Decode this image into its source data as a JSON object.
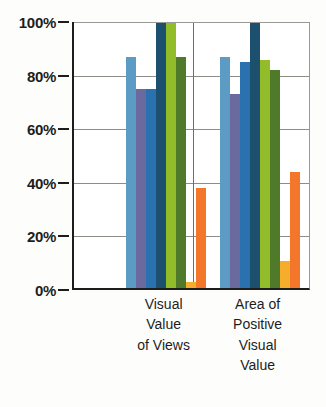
{
  "chart_data": {
    "type": "bar",
    "title": "",
    "subtitle": "",
    "xlabel": "",
    "ylabel": "",
    "ylim": [
      0,
      100
    ],
    "grid": true,
    "legend": "none",
    "y_tick_labels": [
      "100%",
      "80%",
      "60%",
      "40%",
      "20%",
      "0%"
    ],
    "y_tick_values": [
      100,
      80,
      60,
      40,
      20,
      0
    ],
    "categories": [
      "Visual Value of Views",
      "Area of Positive Visual Value"
    ],
    "category_label_lines": [
      [
        "Visual",
        "Value",
        "of Views"
      ],
      [
        "Area of",
        "Positive",
        "Visual",
        "Value"
      ]
    ],
    "series": [
      {
        "name": "series-1",
        "color": "#5b9bc4",
        "values": [
          87,
          87
        ]
      },
      {
        "name": "series-2",
        "color": "#6b6a9e",
        "values": [
          75,
          73
        ]
      },
      {
        "name": "series-3",
        "color": "#2a72af",
        "values": [
          75,
          85
        ]
      },
      {
        "name": "series-4",
        "color": "#1d4f6e",
        "values": [
          104,
          104
        ]
      },
      {
        "name": "series-5",
        "color": "#93bc2b",
        "values": [
          104,
          86
        ]
      },
      {
        "name": "series-6",
        "color": "#4f7a2a",
        "values": [
          87,
          82
        ]
      },
      {
        "name": "series-7",
        "color": "#f6ad2b",
        "values": [
          3,
          11
        ]
      },
      {
        "name": "series-8",
        "color": "#f4762a",
        "values": [
          38,
          44
        ]
      }
    ]
  },
  "axis": {
    "y_labels": [
      "100%",
      "80%",
      "60%",
      "40%",
      "20%",
      "0%"
    ]
  },
  "colors": {
    "axis": "#1d1d1b",
    "grid": "#8d8d88",
    "plot_background": "#ffffff",
    "page_background": "#fdfdfc"
  }
}
